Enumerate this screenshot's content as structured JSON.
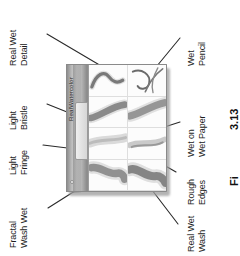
{
  "figure": {
    "orientation": "rotated-90-ccw",
    "panel": {
      "tab_label": "RealWatercolor",
      "grip_icon": "resize-grip-dot",
      "sample_count": 8
    },
    "callouts_left": [
      {
        "id": "real-wet-detail",
        "lines": [
          "Real Wet",
          "Detail"
        ]
      },
      {
        "id": "light-bristle",
        "lines": [
          "Light",
          "Bristle"
        ]
      },
      {
        "id": "light-fringe",
        "lines": [
          "Light",
          "Fringe"
        ]
      },
      {
        "id": "fractal-wash-wet",
        "lines": [
          "Fractal",
          "Wash Wet"
        ]
      }
    ],
    "callouts_right": [
      {
        "id": "wet-pencil",
        "lines": [
          "Wet",
          "Pencil"
        ]
      },
      {
        "id": "wet-on-wet-paper",
        "lines": [
          "Wet on",
          "Wet Paper"
        ]
      },
      {
        "id": "rough-edges",
        "lines": [
          "Rough",
          "Edges"
        ]
      },
      {
        "id": "real-wet-wash",
        "lines": [
          "Real Wet",
          "Wash"
        ]
      }
    ],
    "caption_fragment": {
      "number": "3.13",
      "prefix": "Fi"
    },
    "colors": {
      "text": "#1d1d1d",
      "leader_line": "#2a2a2a",
      "panel_border": "#8a8a8a",
      "panel_chrome": "#b9b9b9",
      "sample_bg": "#fbfbfb",
      "stroke_ink": "#6f6f6f"
    }
  }
}
